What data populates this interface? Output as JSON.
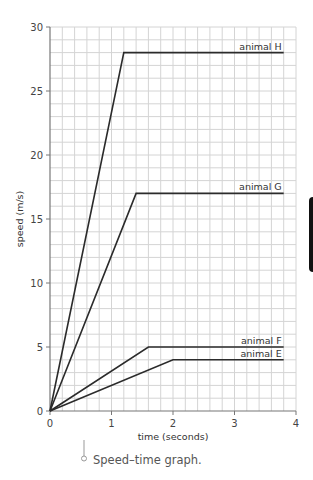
{
  "chart_data": {
    "type": "line",
    "title": "",
    "xlabel": "time (seconds)",
    "ylabel": "speed (m/s)",
    "xlim": [
      0,
      4
    ],
    "ylim": [
      0,
      30
    ],
    "x_ticks": [
      0,
      1,
      2,
      3,
      4
    ],
    "y_ticks": [
      0,
      5,
      10,
      15,
      20,
      25,
      30
    ],
    "grid": true,
    "grid_minor_x": 0.2,
    "grid_minor_y": 1,
    "legend_position": "inline labels at right end of each line",
    "series": [
      {
        "name": "animal H",
        "points": [
          [
            0,
            0
          ],
          [
            1.2,
            28
          ],
          [
            3.8,
            28
          ]
        ]
      },
      {
        "name": "animal G",
        "points": [
          [
            0,
            0
          ],
          [
            1.4,
            17
          ],
          [
            3.8,
            17
          ]
        ]
      },
      {
        "name": "animal F",
        "points": [
          [
            0,
            0
          ],
          [
            1.6,
            5
          ],
          [
            3.8,
            5
          ]
        ]
      },
      {
        "name": "animal E",
        "points": [
          [
            0,
            0
          ],
          [
            2.0,
            4
          ],
          [
            3.8,
            4
          ]
        ]
      }
    ],
    "colors": {
      "line": "#2b2b2b",
      "grid": "#d4d4d4",
      "axis": "#777777"
    }
  },
  "caption": {
    "icon": "pin-marker-icon",
    "text": "Speed–time graph."
  },
  "side_tab": {
    "icon": "side-tab-marker"
  }
}
